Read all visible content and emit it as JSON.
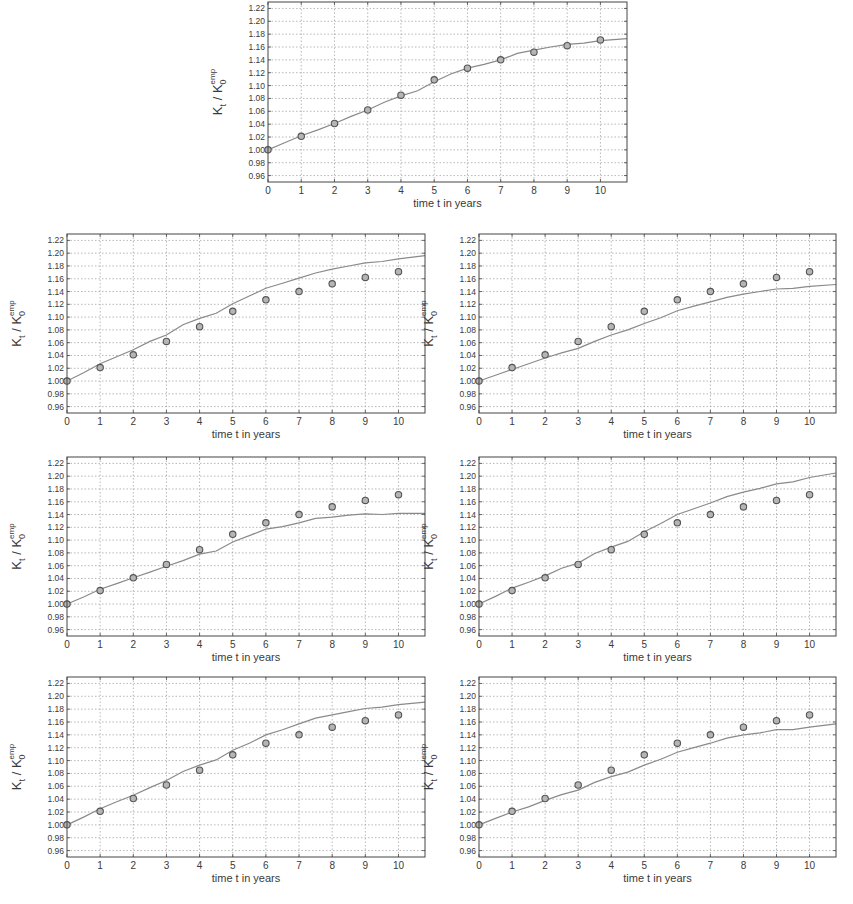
{
  "figure": {
    "panel_count": 7,
    "layout": "1 centered panel on top, then 3 rows x 2 columns",
    "caption_visible": false
  },
  "chart_data": [
    {
      "id": "top-center",
      "type": "line",
      "title": "",
      "xlabel": "time t in years",
      "ylabel": "K_t / K_0^emp",
      "xlim": [
        0,
        10.8
      ],
      "ylim": [
        0.95,
        1.23
      ],
      "xticks": [
        0,
        1,
        2,
        3,
        4,
        5,
        6,
        7,
        8,
        9,
        10
      ],
      "yticks": [
        0.96,
        0.98,
        1.0,
        1.02,
        1.04,
        1.06,
        1.08,
        1.1,
        1.12,
        1.14,
        1.16,
        1.18,
        1.2,
        1.22
      ],
      "ytick_labels": [
        "0.96",
        "0.98",
        "1.00",
        "1.02",
        "1.04",
        "1.06",
        "1.08",
        "1.10",
        "1.12",
        "1.14",
        "1.16",
        "1.18",
        "1.20",
        "1.22"
      ],
      "grid": true,
      "series": [
        {
          "name": "empirical",
          "kind": "scatter-circles",
          "x": [
            0,
            1,
            2,
            3,
            4,
            5,
            6,
            7,
            8,
            9,
            10
          ],
          "y": [
            1.0,
            1.021,
            1.041,
            1.062,
            1.085,
            1.109,
            1.127,
            1.14,
            1.152,
            1.162,
            1.171
          ]
        },
        {
          "name": "model",
          "kind": "line",
          "x": [
            0,
            0.5,
            1,
            1.5,
            2,
            2.5,
            3,
            3.5,
            4,
            4.5,
            5,
            5.5,
            6,
            6.5,
            7,
            7.5,
            8,
            8.5,
            9,
            9.5,
            10,
            10.8
          ],
          "y": [
            1.0,
            1.011,
            1.022,
            1.031,
            1.041,
            1.052,
            1.062,
            1.074,
            1.084,
            1.092,
            1.106,
            1.118,
            1.127,
            1.133,
            1.14,
            1.15,
            1.155,
            1.16,
            1.164,
            1.166,
            1.17,
            1.173
          ]
        }
      ]
    },
    {
      "id": "row1-left",
      "type": "line",
      "xlabel": "time t in years",
      "ylabel": "K_t / K_0^emp",
      "xlim": [
        0,
        10.8
      ],
      "ylim": [
        0.95,
        1.23
      ],
      "grid": true,
      "series": [
        {
          "name": "empirical",
          "kind": "scatter-circles",
          "x": [
            0,
            1,
            2,
            3,
            4,
            5,
            6,
            7,
            8,
            9,
            10
          ],
          "y": [
            1.0,
            1.021,
            1.041,
            1.062,
            1.085,
            1.109,
            1.127,
            1.14,
            1.152,
            1.162,
            1.171
          ]
        },
        {
          "name": "model",
          "kind": "line",
          "x": [
            0,
            0.5,
            1,
            1.5,
            2,
            2.5,
            3,
            3.5,
            4,
            4.5,
            5,
            5.5,
            6,
            6.5,
            7,
            7.5,
            8,
            8.5,
            9,
            9.5,
            10,
            10.8
          ],
          "y": [
            1.0,
            1.013,
            1.027,
            1.038,
            1.049,
            1.062,
            1.072,
            1.088,
            1.098,
            1.106,
            1.121,
            1.133,
            1.145,
            1.153,
            1.161,
            1.169,
            1.175,
            1.18,
            1.185,
            1.187,
            1.191,
            1.196
          ]
        }
      ]
    },
    {
      "id": "row1-right",
      "type": "line",
      "xlabel": "time t in years",
      "ylabel": "K_t / K_0^emp",
      "xlim": [
        0,
        10.8
      ],
      "ylim": [
        0.95,
        1.23
      ],
      "grid": true,
      "series": [
        {
          "name": "empirical",
          "kind": "scatter-circles",
          "x": [
            0,
            1,
            2,
            3,
            4,
            5,
            6,
            7,
            8,
            9,
            10
          ],
          "y": [
            1.0,
            1.021,
            1.041,
            1.062,
            1.085,
            1.109,
            1.127,
            1.14,
            1.152,
            1.162,
            1.171
          ]
        },
        {
          "name": "model",
          "kind": "line",
          "x": [
            0,
            0.5,
            1,
            1.5,
            2,
            2.5,
            3,
            3.5,
            4,
            4.5,
            5,
            5.5,
            6,
            6.5,
            7,
            7.5,
            8,
            8.5,
            9,
            9.5,
            10,
            10.8
          ],
          "y": [
            1.0,
            1.009,
            1.018,
            1.027,
            1.036,
            1.044,
            1.051,
            1.062,
            1.072,
            1.08,
            1.09,
            1.099,
            1.11,
            1.117,
            1.124,
            1.131,
            1.136,
            1.14,
            1.144,
            1.145,
            1.148,
            1.151
          ]
        }
      ]
    },
    {
      "id": "row2-left",
      "type": "line",
      "xlabel": "time t in years",
      "ylabel": "K_t / K_0^emp",
      "xlim": [
        0,
        10.8
      ],
      "ylim": [
        0.95,
        1.23
      ],
      "grid": true,
      "series": [
        {
          "name": "empirical",
          "kind": "scatter-circles",
          "x": [
            0,
            1,
            2,
            3,
            4,
            5,
            6,
            7,
            8,
            9,
            10
          ],
          "y": [
            1.0,
            1.021,
            1.041,
            1.062,
            1.085,
            1.109,
            1.127,
            1.14,
            1.152,
            1.162,
            1.171
          ]
        },
        {
          "name": "model",
          "kind": "line",
          "x": [
            0,
            0.5,
            1,
            1.5,
            2,
            2.5,
            3,
            3.5,
            4,
            4.5,
            5,
            5.5,
            6,
            6.5,
            7,
            7.5,
            8,
            8.5,
            9,
            9.5,
            10,
            10.8
          ],
          "y": [
            1.0,
            1.011,
            1.023,
            1.032,
            1.041,
            1.05,
            1.059,
            1.068,
            1.078,
            1.083,
            1.097,
            1.107,
            1.117,
            1.121,
            1.127,
            1.134,
            1.136,
            1.139,
            1.141,
            1.14,
            1.142,
            1.142
          ]
        }
      ]
    },
    {
      "id": "row2-right",
      "type": "line",
      "xlabel": "time t in years",
      "ylabel": "K_t / K_0^emp",
      "xlim": [
        0,
        10.8
      ],
      "ylim": [
        0.95,
        1.23
      ],
      "grid": true,
      "series": [
        {
          "name": "empirical",
          "kind": "scatter-circles",
          "x": [
            0,
            1,
            2,
            3,
            4,
            5,
            6,
            7,
            8,
            9,
            10
          ],
          "y": [
            1.0,
            1.021,
            1.041,
            1.062,
            1.085,
            1.109,
            1.127,
            1.14,
            1.152,
            1.162,
            1.171
          ]
        },
        {
          "name": "model",
          "kind": "line",
          "x": [
            0,
            0.5,
            1,
            1.5,
            2,
            2.5,
            3,
            3.5,
            4,
            4.5,
            5,
            5.5,
            6,
            6.5,
            7,
            7.5,
            8,
            8.5,
            9,
            9.5,
            10,
            10.8
          ],
          "y": [
            1.0,
            1.012,
            1.025,
            1.034,
            1.044,
            1.056,
            1.064,
            1.079,
            1.089,
            1.098,
            1.113,
            1.126,
            1.14,
            1.149,
            1.158,
            1.168,
            1.175,
            1.181,
            1.188,
            1.191,
            1.198,
            1.205
          ]
        }
      ]
    },
    {
      "id": "row3-left",
      "type": "line",
      "xlabel": "time t in years",
      "ylabel": "K_t / K_0^emp",
      "xlim": [
        0,
        10.8
      ],
      "ylim": [
        0.95,
        1.23
      ],
      "grid": true,
      "series": [
        {
          "name": "empirical",
          "kind": "scatter-circles",
          "x": [
            0,
            1,
            2,
            3,
            4,
            5,
            6,
            7,
            8,
            9,
            10
          ],
          "y": [
            1.0,
            1.021,
            1.041,
            1.062,
            1.085,
            1.109,
            1.127,
            1.14,
            1.152,
            1.162,
            1.171
          ]
        },
        {
          "name": "model",
          "kind": "line",
          "x": [
            0,
            0.5,
            1,
            1.5,
            2,
            2.5,
            3,
            3.5,
            4,
            4.5,
            5,
            5.5,
            6,
            6.5,
            7,
            7.5,
            8,
            8.5,
            9,
            9.5,
            10,
            10.8
          ],
          "y": [
            1.0,
            1.012,
            1.025,
            1.036,
            1.046,
            1.058,
            1.069,
            1.083,
            1.093,
            1.101,
            1.116,
            1.127,
            1.14,
            1.148,
            1.157,
            1.166,
            1.171,
            1.176,
            1.181,
            1.183,
            1.187,
            1.191
          ]
        }
      ]
    },
    {
      "id": "row3-right",
      "type": "line",
      "xlabel": "time t in years",
      "ylabel": "K_t / K_0^emp",
      "xlim": [
        0,
        10.8
      ],
      "ylim": [
        0.95,
        1.23
      ],
      "grid": true,
      "series": [
        {
          "name": "empirical",
          "kind": "scatter-circles",
          "x": [
            0,
            1,
            2,
            3,
            4,
            5,
            6,
            7,
            8,
            9,
            10
          ],
          "y": [
            1.0,
            1.021,
            1.041,
            1.062,
            1.085,
            1.109,
            1.127,
            1.14,
            1.152,
            1.162,
            1.171
          ]
        },
        {
          "name": "model",
          "kind": "line",
          "x": [
            0,
            0.5,
            1,
            1.5,
            2,
            2.5,
            3,
            3.5,
            4,
            4.5,
            5,
            5.5,
            6,
            6.5,
            7,
            7.5,
            8,
            8.5,
            9,
            9.5,
            10,
            10.8
          ],
          "y": [
            1.0,
            1.01,
            1.02,
            1.028,
            1.038,
            1.047,
            1.054,
            1.066,
            1.075,
            1.082,
            1.093,
            1.102,
            1.113,
            1.12,
            1.127,
            1.135,
            1.14,
            1.143,
            1.148,
            1.148,
            1.152,
            1.157
          ]
        }
      ]
    }
  ],
  "panels": [
    {
      "id": "top-center",
      "ylabel_main": "K",
      "ylabel_sub": "t",
      "ylabel_sep": " / K",
      "ylabel_sub0": "0",
      "ylabel_sup": "emp",
      "xlabel": "time t in years"
    },
    {
      "id": "row1-left",
      "ylabel_main": "K",
      "ylabel_sub": "t",
      "ylabel_sep": " / K",
      "ylabel_sub0": "0",
      "ylabel_sup": "emp",
      "xlabel": "time t in years"
    },
    {
      "id": "row1-right",
      "ylabel_main": "K",
      "ylabel_sub": "t",
      "ylabel_sep": " / K",
      "ylabel_sub0": "0",
      "ylabel_sup": "emp",
      "xlabel": "time t in years"
    },
    {
      "id": "row2-left",
      "ylabel_main": "K",
      "ylabel_sub": "t",
      "ylabel_sep": " / K",
      "ylabel_sub0": "0",
      "ylabel_sup": "emp",
      "xlabel": "time t in years"
    },
    {
      "id": "row2-right",
      "ylabel_main": "K",
      "ylabel_sub": "t",
      "ylabel_sep": " / K",
      "ylabel_sub0": "0",
      "ylabel_sup": "emp",
      "xlabel": "time t in years"
    },
    {
      "id": "row3-left",
      "ylabel_main": "K",
      "ylabel_sub": "t",
      "ylabel_sep": " / K",
      "ylabel_sub0": "0",
      "ylabel_sup": "emp",
      "xlabel": "time t in years"
    },
    {
      "id": "row3-right",
      "ylabel_main": "K",
      "ylabel_sub": "t",
      "ylabel_sep": " / K",
      "ylabel_sub0": "0",
      "ylabel_sup": "emp",
      "xlabel": "time t in years"
    }
  ],
  "style": {
    "frame_color": "#444444",
    "grid_color": "#9a9a9a",
    "line_color": "#8a8a8a",
    "marker_stroke": "#555555",
    "marker_fill": "#b5b5b5",
    "text_color": "#3a3a3a"
  }
}
